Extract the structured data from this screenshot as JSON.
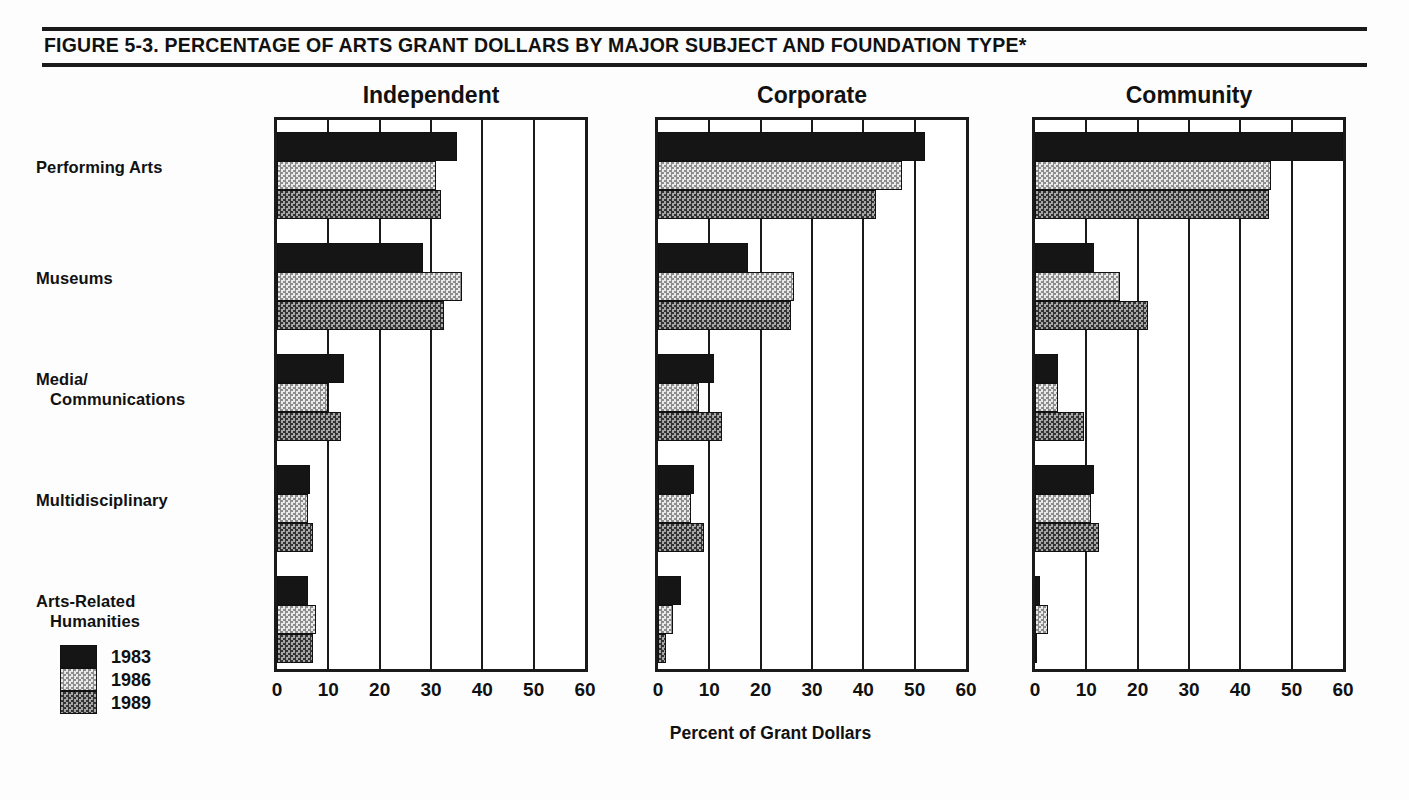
{
  "figure": {
    "title": "FIGURE 5-3.  PERCENTAGE OF ARTS GRANT DOLLARS BY MAJOR SUBJECT AND FOUNDATION TYPE*"
  },
  "chart_data": {
    "type": "bar",
    "orientation": "horizontal",
    "title": "FIGURE 5-3.  PERCENTAGE OF ARTS GRANT DOLLARS BY MAJOR SUBJECT AND FOUNDATION TYPE*",
    "xlabel": "Percent of Grant Dollars",
    "ylabel": "",
    "xlim": [
      0,
      60
    ],
    "xticks": [
      0,
      10,
      20,
      30,
      40,
      50,
      60
    ],
    "xtick_labels": [
      "0",
      "10",
      "20",
      "30",
      "40",
      "50",
      "60"
    ],
    "grid": true,
    "legend_position": "bottom-left",
    "legend": [
      "1983",
      "1986",
      "1989"
    ],
    "series_colors": [
      "#151515",
      "#d2d2d2",
      "#6a6a6a"
    ],
    "categories": [
      "Performing Arts",
      "Museums",
      "Media/ Communications",
      "Multidisciplinary",
      "Arts-Related Humanities"
    ],
    "category_lines": [
      [
        "Performing Arts"
      ],
      [
        "Museums"
      ],
      [
        "Media/",
        "Communications"
      ],
      [
        "Multidisciplinary"
      ],
      [
        "Arts-Related",
        "Humanities"
      ]
    ],
    "panels": [
      {
        "name": "Independent",
        "series": [
          {
            "name": "1983",
            "values": [
              35.0,
              28.5,
              13.0,
              6.5,
              6.0
            ]
          },
          {
            "name": "1986",
            "values": [
              31.0,
              36.0,
              10.0,
              6.0,
              7.5
            ]
          },
          {
            "name": "1989",
            "values": [
              32.0,
              32.5,
              12.5,
              7.0,
              7.0
            ]
          }
        ]
      },
      {
        "name": "Corporate",
        "series": [
          {
            "name": "1983",
            "values": [
              52.0,
              17.5,
              11.0,
              7.0,
              4.5
            ]
          },
          {
            "name": "1986",
            "values": [
              47.5,
              26.5,
              8.0,
              6.5,
              3.0
            ]
          },
          {
            "name": "1989",
            "values": [
              42.5,
              26.0,
              12.5,
              9.0,
              1.5
            ]
          }
        ]
      },
      {
        "name": "Community",
        "series": [
          {
            "name": "1983",
            "values": [
              60.0,
              11.5,
              4.5,
              11.5,
              1.0
            ]
          },
          {
            "name": "1986",
            "values": [
              46.0,
              16.5,
              4.5,
              11.0,
              2.5
            ]
          },
          {
            "name": "1989",
            "values": [
              45.5,
              22.0,
              9.5,
              12.5,
              0.4
            ]
          }
        ]
      }
    ]
  }
}
